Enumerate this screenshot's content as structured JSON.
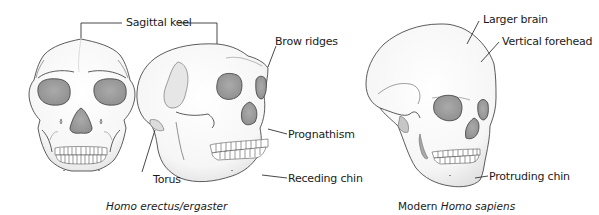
{
  "diagram": {
    "type": "anatomical comparison illustration",
    "colors": {
      "bone": "#f7f7f7",
      "bone_shade": "#e4e4e4",
      "socket": "#9c9c9c",
      "outline": "#4a4a4a",
      "leader": "#333333",
      "text": "#1a1a1a"
    },
    "specimens": [
      {
        "id": "erectus",
        "caption_species": "Homo erectus/ergaster",
        "views": [
          "front view",
          "side view"
        ],
        "labels": {
          "sagittal_keel": "Sagittal keel",
          "brow_ridges": "Brow ridges",
          "prognathism": "Prognathism",
          "torus": "Torus",
          "receding_chin": "Receding chin"
        }
      },
      {
        "id": "sapiens",
        "caption_prefix": "Modern ",
        "caption_species": "Homo sapiens",
        "views": [
          "three-quarter view"
        ],
        "labels": {
          "larger_brain": "Larger brain",
          "vertical_forehead": "Vertical forehead",
          "protruding_chin": "Protruding chin"
        }
      }
    ]
  }
}
